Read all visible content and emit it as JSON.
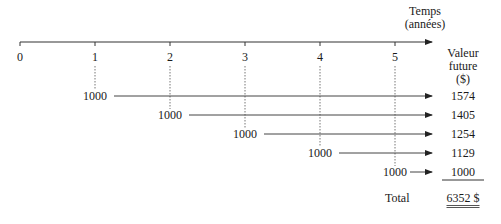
{
  "axis": {
    "label_line1": "Temps",
    "label_line2": "(années)",
    "ticks": [
      "0",
      "1",
      "2",
      "3",
      "4",
      "5"
    ]
  },
  "column_header": {
    "line1": "Valeur",
    "line2": "future",
    "line3": "($)"
  },
  "cash_flows": [
    {
      "year": "1",
      "amount": "1000",
      "future_value": "1574"
    },
    {
      "year": "2",
      "amount": "1000",
      "future_value": "1405"
    },
    {
      "year": "3",
      "amount": "1000",
      "future_value": "1254"
    },
    {
      "year": "4",
      "amount": "1000",
      "future_value": "1129"
    },
    {
      "year": "5",
      "amount": "1000",
      "future_value": "1000"
    }
  ],
  "total": {
    "label": "Total",
    "value": "6352 $"
  },
  "colors": {
    "line": "#333333",
    "dotted": "#777777"
  }
}
